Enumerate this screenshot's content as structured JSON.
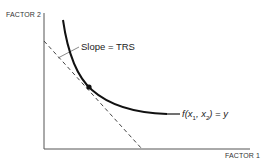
{
  "diagram": {
    "y_axis_label": "FACTOR 2",
    "x_axis_label": "FACTOR 1",
    "tangent_label": "Slope = TRS",
    "curve_label": {
      "prefix": "f(",
      "var1": "x",
      "sub1": "1",
      "sep": ", ",
      "var2": "x",
      "sub2": "2",
      "suffix": ") = y"
    },
    "colors": {
      "axis": "#555555",
      "curve": "#111111",
      "tangent": "#444444",
      "text": "#222222"
    }
  }
}
